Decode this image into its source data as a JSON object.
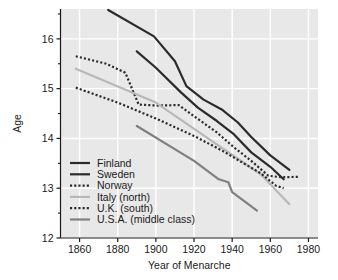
{
  "chart_data": {
    "type": "line",
    "title": "",
    "xlabel": "Year of Menarche",
    "ylabel": "Age",
    "xlim": [
      1850,
      1985
    ],
    "ylim": [
      12,
      16.6
    ],
    "xticks": [
      1860,
      1880,
      1900,
      1920,
      1940,
      1960,
      1980
    ],
    "xticklabels": [
      "1860",
      "1880",
      "1900",
      "1920",
      "1940",
      "1960",
      "1980"
    ],
    "yticks": [
      12,
      13,
      14,
      15,
      16
    ],
    "yticklabels": [
      "12",
      "13",
      "14",
      "15",
      "16"
    ],
    "yminorticks": [
      12.5,
      13.5,
      14.5,
      15.5,
      16.5
    ],
    "grid": true,
    "grid_color": "#ffffff",
    "plot_bgcolor": "#e8e8e8",
    "legend_position": "lower left",
    "series": [
      {
        "name": "Finland",
        "style": "solid",
        "color": "#2b2b2b",
        "width": 2.2,
        "points": [
          [
            1875,
            16.58
          ],
          [
            1899,
            16.05
          ],
          [
            1901,
            15.96
          ],
          [
            1910,
            15.55
          ],
          [
            1916,
            15.05
          ],
          [
            1925,
            14.78
          ],
          [
            1935,
            14.57
          ],
          [
            1943,
            14.32
          ],
          [
            1950,
            14.03
          ],
          [
            1960,
            13.66
          ],
          [
            1970,
            13.37
          ]
        ]
      },
      {
        "name": "Sweden",
        "style": "solid",
        "color": "#2b2b2b",
        "width": 2.2,
        "points": [
          [
            1890,
            15.75
          ],
          [
            1900,
            15.42
          ],
          [
            1913,
            14.93
          ],
          [
            1922,
            14.62
          ],
          [
            1932,
            14.35
          ],
          [
            1941,
            14.08
          ],
          [
            1950,
            13.72
          ],
          [
            1960,
            13.43
          ],
          [
            1967,
            13.18
          ]
        ]
      },
      {
        "name": "Norway",
        "style": "dotted",
        "color": "#2b2b2b",
        "width": 2.2,
        "points": [
          [
            1858,
            15.65
          ],
          [
            1874,
            15.5
          ],
          [
            1884,
            15.32
          ],
          [
            1891,
            14.68
          ],
          [
            1901,
            14.66
          ],
          [
            1912,
            14.67
          ],
          [
            1921,
            14.42
          ],
          [
            1932,
            14.12
          ],
          [
            1941,
            13.82
          ],
          [
            1950,
            13.55
          ],
          [
            1959,
            13.25
          ],
          [
            1966,
            13.22
          ],
          [
            1975,
            13.23
          ]
        ]
      },
      {
        "name": "Italy (north)",
        "style": "solid",
        "color": "#b8b8b8",
        "width": 2.2,
        "points": [
          [
            1858,
            15.4
          ],
          [
            1900,
            14.72
          ],
          [
            1930,
            13.93
          ],
          [
            1955,
            13.28
          ],
          [
            1970,
            12.68
          ]
        ]
      },
      {
        "name": "U.K. (south)",
        "style": "dotted",
        "color": "#2b2b2b",
        "width": 2.2,
        "points": [
          [
            1858,
            15.02
          ],
          [
            1880,
            14.72
          ],
          [
            1900,
            14.4
          ],
          [
            1920,
            14.05
          ],
          [
            1935,
            13.75
          ],
          [
            1946,
            13.5
          ],
          [
            1955,
            13.3
          ],
          [
            1963,
            13.05
          ],
          [
            1967,
            13.0
          ]
        ]
      },
      {
        "name": "U.S.A. (middle class)",
        "style": "solid",
        "color": "#808080",
        "width": 2.2,
        "points": [
          [
            1890,
            14.25
          ],
          [
            1920,
            13.55
          ],
          [
            1933,
            13.18
          ],
          [
            1938,
            13.12
          ],
          [
            1940,
            12.92
          ],
          [
            1953,
            12.55
          ]
        ]
      }
    ]
  },
  "legend": {
    "items": [
      {
        "label": "Finland",
        "style": "solid",
        "color": "#2b2b2b"
      },
      {
        "label": "Sweden",
        "style": "solid",
        "color": "#2b2b2b"
      },
      {
        "label": "Norway",
        "style": "dotted",
        "color": "#2b2b2b"
      },
      {
        "label": "Italy (north)",
        "style": "solid",
        "color": "#b8b8b8"
      },
      {
        "label": "U.K. (south)",
        "style": "dotted",
        "color": "#2b2b2b"
      },
      {
        "label": "U.S.A. (middle class)",
        "style": "solid",
        "color": "#808080"
      }
    ]
  }
}
